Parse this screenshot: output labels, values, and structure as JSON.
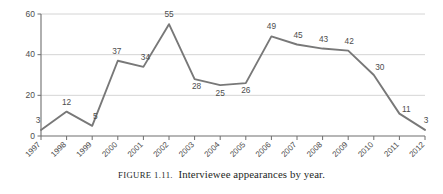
{
  "figure": {
    "caption_label": "FIGURE 1.11.",
    "caption_text": "Interviewee appearances by year."
  },
  "chart_data": {
    "type": "line",
    "title": "",
    "xlabel": "",
    "ylabel": "",
    "categories": [
      "1997",
      "1998",
      "1999",
      "2000",
      "2001",
      "2002",
      "2003",
      "2004",
      "2005",
      "2006",
      "2007",
      "2008",
      "2009",
      "2010",
      "2011",
      "2012"
    ],
    "values": [
      3,
      12,
      5,
      37,
      34,
      55,
      28,
      25,
      26,
      49,
      45,
      43,
      42,
      30,
      11,
      3
    ],
    "series": [
      {
        "name": "Interviewee appearances",
        "values": [
          3,
          12,
          5,
          37,
          34,
          55,
          28,
          25,
          26,
          49,
          45,
          43,
          42,
          30,
          11,
          3
        ]
      }
    ],
    "ylim": [
      0,
      60
    ],
    "yticks": [
      0,
      20,
      40,
      60
    ],
    "ytick_labels": [
      "0",
      "20",
      "40",
      "60"
    ],
    "grid": true,
    "grid_axis": "y",
    "legend": false,
    "legend_position": "none",
    "data_labels": [
      "3",
      "12",
      "5",
      "37",
      "34",
      "55",
      "28",
      "25",
      "26",
      "49",
      "45",
      "43",
      "42",
      "30",
      "11",
      "3"
    ],
    "line_color": "#787878",
    "grid_color": "#c9c9c9",
    "axis_color": "#6e6e6e",
    "label_color": "#4d4d4d",
    "xtick_rotation": 45
  }
}
